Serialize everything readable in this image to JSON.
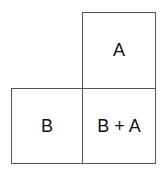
{
  "diagram": {
    "cells": [
      {
        "id": "a",
        "label": "A"
      },
      {
        "id": "b",
        "label": "B"
      },
      {
        "id": "ba",
        "label": "B + A"
      }
    ],
    "line_color": "#555555",
    "background": "#ffffff"
  }
}
